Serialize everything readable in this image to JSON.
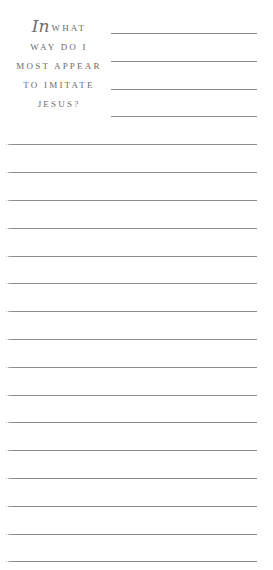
{
  "prompt": {
    "script_word": "In",
    "lines": [
      "what",
      "way do I",
      "most appear",
      "to imitate",
      "Jesus?"
    ]
  },
  "colors": {
    "text": "#6b6b6b",
    "rule": "#8a8a8a",
    "background": "#ffffff"
  },
  "short_lines": {
    "count": 4,
    "tops": [
      33,
      61,
      89,
      116
    ]
  },
  "full_lines": {
    "count": 16,
    "tops": [
      144,
      172,
      200,
      228,
      256,
      283,
      311,
      339,
      367,
      395,
      422,
      450,
      478,
      506,
      534,
      561
    ]
  }
}
